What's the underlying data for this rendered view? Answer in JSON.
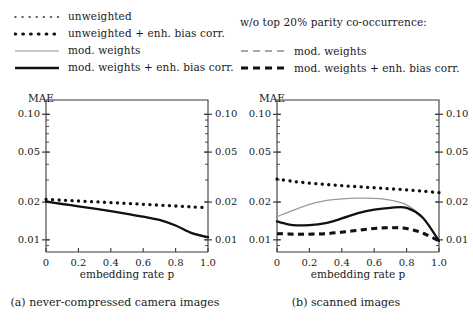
{
  "legend_left": {
    "items": [
      {
        "label": "unweighted",
        "style": "fine-dotted"
      },
      {
        "label": "unweighted + enh. bias corr.",
        "style": "bold-dotted"
      },
      {
        "label": "mod. weights",
        "style": "thin-solid-gray"
      },
      {
        "label": "mod. weights + enh. bias corr.",
        "style": "thick-solid-black"
      }
    ]
  },
  "legend_right": {
    "title": "w/o top 20% parity co-occurrence:",
    "items": [
      {
        "label": "mod. weights",
        "style": "thin-dashed-gray"
      },
      {
        "label": "mod. weights + enh. bias corr.",
        "style": "thick-dashed-black"
      }
    ]
  },
  "chart_data": [
    {
      "type": "line",
      "panel": "a",
      "caption": "(a) never-compressed camera images",
      "title": "",
      "xlabel": "embedding rate p",
      "ylabel": "MAE",
      "yscale": "log",
      "ylim": [
        0.008,
        0.13
      ],
      "xlim": [
        0,
        1
      ],
      "yticks": [
        0.01,
        0.02,
        0.05,
        0.1
      ],
      "ytick_labels": [
        "0.01",
        "0.02",
        "0.05",
        "0.10"
      ],
      "xticks": [
        0,
        0.2,
        0.4,
        0.6,
        0.8,
        1.0
      ],
      "xtick_labels": [
        "0",
        "0.2",
        "0.4",
        "0.6",
        "0.8",
        "1.0"
      ],
      "grid": false,
      "legend_position": "above-figure",
      "x": [
        0,
        0.1,
        0.2,
        0.3,
        0.4,
        0.5,
        0.6,
        0.7,
        0.8,
        0.9,
        1.0
      ],
      "series": [
        {
          "name": "unweighted + enh. bias corr.",
          "style": "bold-dotted",
          "values": [
            0.021,
            0.0207,
            0.0204,
            0.0201,
            0.0198,
            0.0195,
            0.0192,
            0.0189,
            0.0186,
            0.0183,
            0.018
          ]
        },
        {
          "name": "mod. weights",
          "style": "thin-solid-gray",
          "values": [
            0.0202,
            0.0193,
            0.0185,
            0.0177,
            0.0169,
            0.0161,
            0.0153,
            0.0144,
            0.013,
            0.0114,
            0.0106
          ]
        },
        {
          "name": "mod. weights + enh. bias corr.",
          "style": "thick-solid-black",
          "values": [
            0.0202,
            0.0193,
            0.0185,
            0.0177,
            0.0169,
            0.0161,
            0.0153,
            0.0144,
            0.013,
            0.0113,
            0.0105
          ]
        }
      ]
    },
    {
      "type": "line",
      "panel": "b",
      "caption": "(b) scanned images",
      "title": "",
      "xlabel": "embedding rate p",
      "ylabel": "MAE",
      "yscale": "log",
      "ylim": [
        0.008,
        0.13
      ],
      "xlim": [
        0,
        1
      ],
      "yticks": [
        0.01,
        0.02,
        0.05,
        0.1
      ],
      "ytick_labels": [
        "0.01",
        "0.02",
        "0.05",
        "0.10"
      ],
      "xticks": [
        0,
        0.2,
        0.4,
        0.6,
        0.8,
        1.0
      ],
      "xtick_labels": [
        "0",
        "0.2",
        "0.4",
        "0.6",
        "0.8",
        "1.0"
      ],
      "grid": false,
      "legend_position": "above-figure",
      "x": [
        0,
        0.1,
        0.2,
        0.3,
        0.4,
        0.5,
        0.6,
        0.7,
        0.8,
        0.9,
        1.0
      ],
      "series": [
        {
          "name": "unweighted + enh. bias corr.",
          "style": "bold-dotted",
          "values": [
            0.0305,
            0.0292,
            0.0283,
            0.0276,
            0.027,
            0.0265,
            0.026,
            0.0255,
            0.025,
            0.0244,
            0.0238
          ]
        },
        {
          "name": "mod. weights",
          "style": "thin-solid-gray",
          "values": [
            0.0153,
            0.0172,
            0.0192,
            0.0205,
            0.0212,
            0.0215,
            0.0214,
            0.0207,
            0.019,
            0.015,
            0.0098
          ]
        },
        {
          "name": "mod. weights + enh. bias corr.",
          "style": "thick-solid-black",
          "values": [
            0.014,
            0.0131,
            0.0131,
            0.0136,
            0.0148,
            0.0163,
            0.0174,
            0.018,
            0.018,
            0.015,
            0.0098
          ]
        },
        {
          "name": "mod. weights (w/o top 20%)",
          "style": "thin-dashed-gray",
          "values": [
            0.0113,
            0.0112,
            0.0112,
            0.0113,
            0.0116,
            0.012,
            0.0124,
            0.0126,
            0.0124,
            0.0114,
            0.0098
          ]
        },
        {
          "name": "mod. weights + enh. bias corr. (w/o top 20%)",
          "style": "thick-dashed-black",
          "values": [
            0.0112,
            0.0111,
            0.0111,
            0.0112,
            0.0115,
            0.0119,
            0.0123,
            0.0125,
            0.0123,
            0.0113,
            0.0098
          ]
        }
      ]
    }
  ],
  "colors": {
    "axis": "#3a3a3a",
    "black_curve": "#111111",
    "gray_curve": "#9a9a9a",
    "text": "#1a1a1a"
  }
}
